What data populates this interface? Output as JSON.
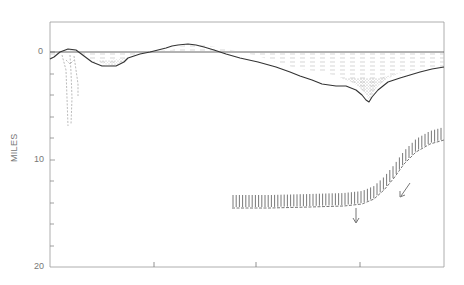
{
  "figure": {
    "type": "cross-section",
    "y_axis": {
      "title": "MILES",
      "tick_labels": [
        "0",
        "10",
        "20"
      ],
      "range": [
        0,
        20
      ],
      "minor_ticks_every": 2
    },
    "x_axis": {
      "tick_labels": [],
      "ticks_count": 3
    },
    "elements": [
      {
        "name": "sea-level-line",
        "description": "horizontal line at depth 0"
      },
      {
        "name": "ocean-water",
        "description": "dashed-fill water layer between sea level and seafloor"
      },
      {
        "name": "seafloor-profile",
        "description": "bathymetric profile with deep trench near right"
      },
      {
        "name": "trench-sediment",
        "description": "stippled sediment fill in trench"
      },
      {
        "name": "island-root",
        "description": "dashed downward root beneath left high"
      },
      {
        "name": "descending-slab",
        "description": "hatched band dipping from right, flattening at ~13.5 miles depth"
      },
      {
        "name": "down-arrow",
        "description": "vertical arrow below slab"
      },
      {
        "name": "diagonal-arrow",
        "description": "arrow pointing down-left along slab"
      }
    ],
    "colors": {
      "line": "#444444",
      "frame": "#888888",
      "fill_dash": "#b8b8b8",
      "stipple": "#999999"
    }
  }
}
